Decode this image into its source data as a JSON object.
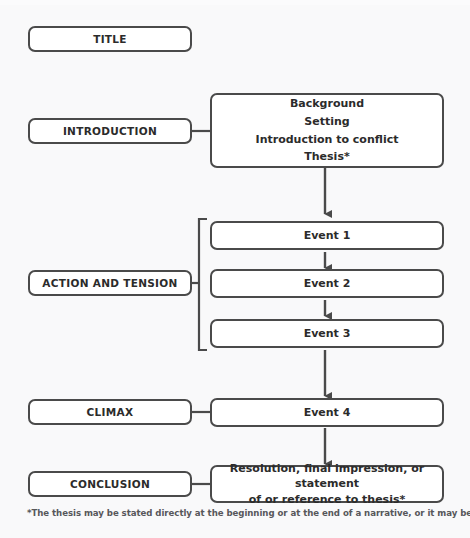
{
  "diagram": {
    "title_box": {
      "label": "TITLE"
    },
    "stages": [
      {
        "name": "introduction",
        "label": "INTRODUCTION"
      },
      {
        "name": "action-and-tension",
        "label": "ACTION AND TENSION"
      },
      {
        "name": "climax",
        "label": "CLIMAX"
      },
      {
        "name": "conclusion",
        "label": "CONCLUSION"
      }
    ],
    "introduction_content": {
      "lines": [
        "Background",
        "Setting",
        "Introduction to conflict",
        "Thesis*"
      ]
    },
    "events": [
      {
        "label": "Event 1"
      },
      {
        "label": "Event 2"
      },
      {
        "label": "Event 3"
      },
      {
        "label": "Event 4"
      }
    ],
    "conclusion_content": {
      "lines": [
        "Resolution, final impression, or statement",
        "of or reference to thesis*"
      ]
    },
    "footnote": "*The thesis may be stated directly at the beginning or at the end of a narrative, or it may be implied.",
    "colors": {
      "stroke": "#4a4a4a",
      "fill": "#ffffff",
      "background": "#f9f9fa",
      "text": "#2b2b2b"
    }
  }
}
